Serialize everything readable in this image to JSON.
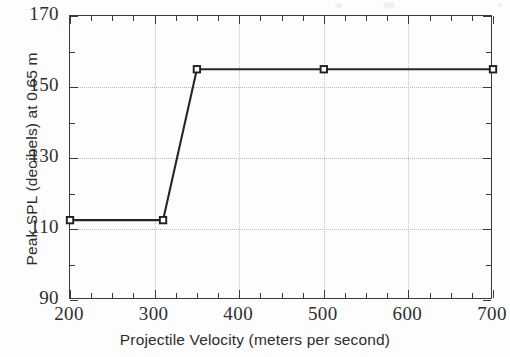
{
  "figure": {
    "background_color": "#fdfdfd",
    "frame_color": "#3a3a3a",
    "grid_color": "#bdbdbd",
    "line_color": "#262626",
    "marker_face_color": "#ffffff"
  },
  "chart_data": {
    "type": "line",
    "title": "",
    "subtitle": "",
    "xlabel": "Projectile Velocity (meters per second)",
    "ylabel": "Peak SPL (decibels) at 0.65 m",
    "xlim": [
      200,
      700
    ],
    "ylim": [
      90,
      170
    ],
    "x_major_ticks": [
      200,
      300,
      400,
      500,
      600,
      700
    ],
    "x_tick_labels": [
      "200",
      "300",
      "400",
      "500",
      "600",
      "700"
    ],
    "x_minor_interval": 25,
    "y_major_ticks": [
      90,
      110,
      130,
      150,
      170
    ],
    "y_tick_labels": [
      "90",
      "110",
      "130",
      "150",
      "170"
    ],
    "y_minor_interval": 10,
    "grid": "both",
    "grid_style": "dotted",
    "legend": "none",
    "marker": "open-square",
    "series": [
      {
        "name": "Peak SPL",
        "x": [
          200,
          310,
          350,
          500,
          700
        ],
        "y": [
          112.5,
          112.5,
          155,
          155,
          155
        ]
      }
    ],
    "points": [
      {
        "x": 200,
        "y": 112.5
      },
      {
        "x": 310,
        "y": 112.5
      },
      {
        "x": 350,
        "y": 155
      },
      {
        "x": 500,
        "y": 155
      },
      {
        "x": 700,
        "y": 155
      }
    ],
    "annotations": []
  },
  "axes": {
    "y_tick_labels": [
      "170",
      "150",
      "130",
      "110",
      "90"
    ],
    "x_tick_labels": [
      "200",
      "300",
      "400",
      "500",
      "600",
      "700"
    ],
    "x_title": "Projectile Velocity (meters per second)",
    "y_title": "Peak SPL (decibels) at 0.65 m"
  }
}
